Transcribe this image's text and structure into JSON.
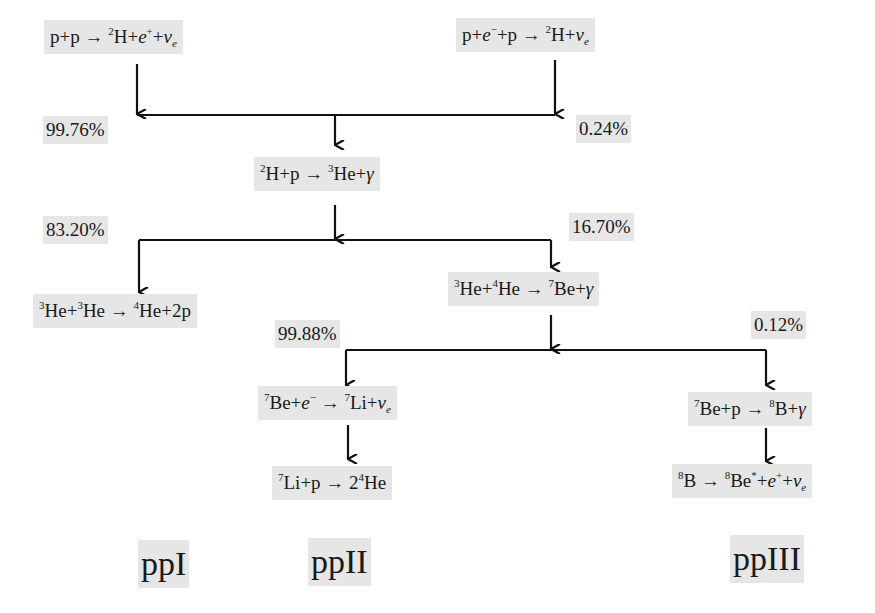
{
  "diagram": {
    "reactions": {
      "pp": {
        "text": "p+p → ²H+e⁺+νe"
      },
      "pep": {
        "text": "p+e⁻+p → ²H+νe"
      },
      "dp": {
        "text": "²H+p → ³He+γ"
      },
      "he3he3": {
        "text": "³He+³He → ⁴He+2p"
      },
      "he3he4": {
        "text": "³He+⁴He → ⁷Be+γ"
      },
      "be7e": {
        "text": "⁷Be+e⁻ → ⁷Li+νe"
      },
      "li7p": {
        "text": "⁷Li+p → 2⁴He"
      },
      "be7p": {
        "text": "⁷Be+p → ⁸B+γ"
      },
      "b8decay": {
        "text": "⁸B → ⁸Be*+e⁺+νe"
      }
    },
    "branch_percentages": {
      "pp": "99.76%",
      "pep": "0.24%",
      "ppI": "83.20%",
      "ppII_III": "16.70%",
      "ppII": "99.88%",
      "ppIII": "0.12%"
    },
    "chain_labels": [
      "ppI",
      "ppII",
      "ppIII"
    ]
  }
}
